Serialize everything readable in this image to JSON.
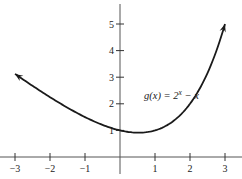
{
  "chart_data": {
    "type": "line",
    "title": "",
    "xlabel": "",
    "ylabel": "",
    "xlim": [
      -3.4,
      3.4
    ],
    "ylim": [
      -0.8,
      5.9
    ],
    "grid": false,
    "x_ticks": [
      -3,
      -2,
      -1,
      1,
      2,
      3
    ],
    "x_tick_labels": [
      "−3",
      "−2",
      "−1",
      "1",
      "2",
      "3"
    ],
    "y_ticks": [
      1,
      2,
      3,
      4,
      5
    ],
    "y_tick_labels": [
      "1",
      "2",
      "3",
      "4",
      "5"
    ],
    "series": [
      {
        "name": "g(x) = 2^x − x",
        "function": "2^x - x",
        "x_range": [
          -3,
          3
        ],
        "arrows": [
          "left",
          "right"
        ],
        "x": [
          -3,
          -2.5,
          -2,
          -1.5,
          -1,
          -0.5,
          0,
          0.5,
          1,
          1.5,
          2,
          2.5,
          3
        ],
        "y": [
          3.125,
          2.677,
          2.25,
          1.854,
          1.5,
          1.207,
          1,
          0.914,
          1,
          1.328,
          2,
          3.157,
          5
        ]
      }
    ],
    "annotations": [
      {
        "text_main": "g(x) = 2",
        "text_sup": "x",
        "text_tail": " − x",
        "anchor_x": 1.0,
        "anchor_y": 2.3
      }
    ]
  }
}
